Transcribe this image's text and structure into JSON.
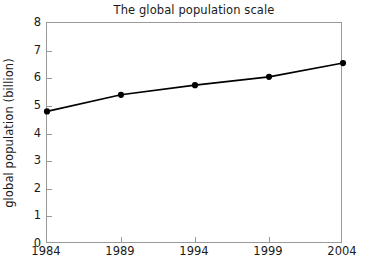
{
  "chart_data": {
    "type": "line",
    "title": "The global population scale",
    "xlabel": "",
    "ylabel": "global population (billion)",
    "x": [
      1984,
      1989,
      1994,
      1999,
      2004
    ],
    "categories": [
      "1984",
      "1989",
      "1994",
      "1999",
      "2004"
    ],
    "values": [
      4.8,
      5.4,
      5.75,
      6.05,
      6.55
    ],
    "series": [
      {
        "name": "global population",
        "values": [
          4.8,
          5.4,
          5.75,
          6.05,
          6.55
        ]
      }
    ],
    "xlim": [
      1984,
      2004
    ],
    "ylim": [
      0,
      8
    ],
    "xticks": [
      "1984",
      "1989",
      "1994",
      "1999",
      "2004"
    ],
    "yticks": [
      "0",
      "1",
      "2",
      "3",
      "4",
      "5",
      "6",
      "7",
      "8"
    ],
    "grid": false,
    "legend": null,
    "marker": "filled-circle",
    "line_color": "#000000",
    "marker_color": "#000000",
    "frame_color": "#9a9a9a",
    "background": "#ffffff"
  }
}
